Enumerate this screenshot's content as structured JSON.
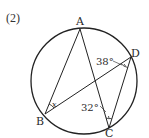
{
  "problem": {
    "number": "(2)"
  },
  "diagram": {
    "circle": {
      "cx": 84,
      "cy": 81,
      "r": 53
    },
    "points": {
      "A": {
        "label": "A",
        "x": 80,
        "y": 29
      },
      "B": {
        "label": "B",
        "x": 45,
        "y": 114
      },
      "C": {
        "label": "C",
        "x": 109,
        "y": 128
      },
      "D": {
        "label": "D",
        "x": 131,
        "y": 57
      }
    },
    "segments": [
      "AB",
      "AC",
      "BD",
      "DC"
    ],
    "angles": {
      "angle_BDC": {
        "label": "38°",
        "vertex": "D"
      },
      "angle_ACD": {
        "label": "32°",
        "vertex": "C"
      },
      "angle_ABD": {
        "label": "x",
        "vertex": "B"
      }
    },
    "colors": {
      "stroke": "#222222",
      "text": "#2a2a2a",
      "background": "#ffffff"
    }
  }
}
